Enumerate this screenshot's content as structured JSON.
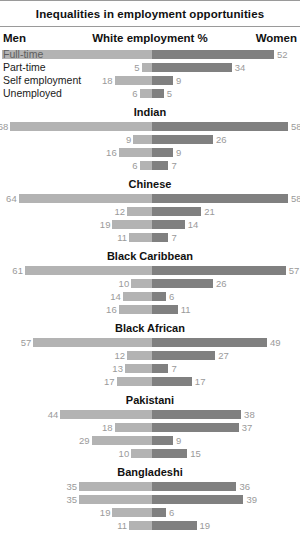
{
  "header": {
    "title": "Inequalities in employment opportunities",
    "left_label": "Men",
    "center_label": "White employment %",
    "right_label": "Women"
  },
  "row_labels": [
    "Full-time",
    "Part-time",
    "Self employment",
    "Unemployed"
  ],
  "colors": {
    "men_bar": "#b3b3b3",
    "women_bar": "#808080",
    "value_text": "#9a9a9a",
    "rule": "#9a9a9a",
    "text": "#111111",
    "background": "#ffffff"
  },
  "chart_data": {
    "type": "bar",
    "title": "Inequalities in employment opportunities",
    "subtitle": "White employment %",
    "xlabel": "",
    "ylabel": "",
    "orientation": "horizontal-diverging",
    "xlim": [
      0,
      80
    ],
    "grid": false,
    "legend_position": "top",
    "series": [
      {
        "name": "Men",
        "side": "left",
        "color": "#b3b3b3"
      },
      {
        "name": "Women",
        "side": "right",
        "color": "#808080"
      }
    ],
    "categories": [
      "Full-time",
      "Part-time",
      "Self employment",
      "Unemployed"
    ],
    "groups": [
      {
        "name": "White",
        "header_shown": false,
        "rows": [
          {
            "category": "Full-time",
            "men": 72,
            "women": 52
          },
          {
            "category": "Part-time",
            "men": 5,
            "women": 34
          },
          {
            "category": "Self employment",
            "men": 18,
            "women": 9
          },
          {
            "category": "Unemployed",
            "men": 6,
            "women": 5
          }
        ]
      },
      {
        "name": "Indian",
        "header_shown": true,
        "rows": [
          {
            "category": "Full-time",
            "men": 68,
            "women": 58
          },
          {
            "category": "Part-time",
            "men": 9,
            "women": 26
          },
          {
            "category": "Self employment",
            "men": 16,
            "women": 9
          },
          {
            "category": "Unemployed",
            "men": 6,
            "women": 7
          }
        ]
      },
      {
        "name": "Chinese",
        "header_shown": true,
        "rows": [
          {
            "category": "Full-time",
            "men": 64,
            "women": 58
          },
          {
            "category": "Part-time",
            "men": 12,
            "women": 21
          },
          {
            "category": "Self employment",
            "men": 19,
            "women": 14
          },
          {
            "category": "Unemployed",
            "men": 11,
            "women": 7
          }
        ]
      },
      {
        "name": "Black Caribbean",
        "header_shown": true,
        "rows": [
          {
            "category": "Full-time",
            "men": 61,
            "women": 57
          },
          {
            "category": "Part-time",
            "men": 10,
            "women": 26
          },
          {
            "category": "Self employment",
            "men": 14,
            "women": 6
          },
          {
            "category": "Unemployed",
            "men": 16,
            "women": 11
          }
        ]
      },
      {
        "name": "Black African",
        "header_shown": true,
        "rows": [
          {
            "category": "Full-time",
            "men": 57,
            "women": 49
          },
          {
            "category": "Part-time",
            "men": 12,
            "women": 27
          },
          {
            "category": "Self employment",
            "men": 13,
            "women": 7
          },
          {
            "category": "Unemployed",
            "men": 17,
            "women": 17
          }
        ]
      },
      {
        "name": "Pakistani",
        "header_shown": true,
        "rows": [
          {
            "category": "Full-time",
            "men": 44,
            "women": 38
          },
          {
            "category": "Part-time",
            "men": 18,
            "women": 37
          },
          {
            "category": "Self employment",
            "men": 29,
            "women": 9
          },
          {
            "category": "Unemployed",
            "men": 10,
            "women": 15
          }
        ]
      },
      {
        "name": "Bangladeshi",
        "header_shown": true,
        "rows": [
          {
            "category": "Full-time",
            "men": 35,
            "women": 36
          },
          {
            "category": "Part-time",
            "men": 35,
            "women": 39
          },
          {
            "category": "Self employment",
            "men": 19,
            "women": 6
          },
          {
            "category": "Unemployed",
            "men": 11,
            "women": 19
          }
        ]
      }
    ]
  }
}
